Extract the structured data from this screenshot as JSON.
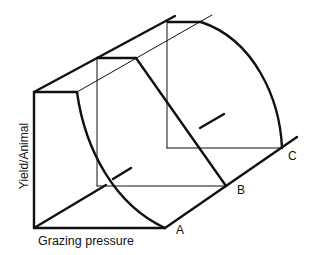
{
  "diagram": {
    "type": "3d-yield-surface",
    "axis_labels": {
      "x": "Grazing pressure",
      "y": "Yield/Animal"
    },
    "points": [
      {
        "id": "A",
        "label": "A"
      },
      {
        "id": "B",
        "label": "B"
      },
      {
        "id": "C",
        "label": "C"
      }
    ],
    "colors": {
      "line": "#111111",
      "background": "#ffffff"
    }
  }
}
